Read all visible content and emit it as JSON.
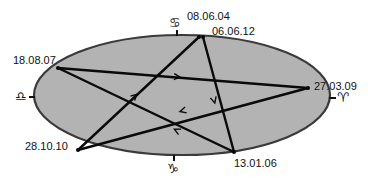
{
  "diagram": {
    "type": "pentagram-in-ellipse",
    "colors": {
      "ellipse_fill": "#b3b3b3",
      "ellipse_stroke": "#3a3a3a",
      "line": "#0a0a0a",
      "text": "#111111"
    },
    "points": {
      "p_top_a": {
        "label": "08.06.04"
      },
      "p_top_b": {
        "label": "06.06.12"
      },
      "p_left": {
        "label": "18.08.07"
      },
      "p_right": {
        "label": "27.03.09"
      },
      "p_bottom_left": {
        "label": "28.10.10"
      },
      "p_bottom_right": {
        "label": "13.01.06"
      }
    },
    "zodiac_markers": {
      "top": {
        "name": "cancer",
        "glyph": "♋"
      },
      "left": {
        "name": "libra",
        "glyph": "♎"
      },
      "right": {
        "name": "aries",
        "glyph": "♈"
      },
      "bottom": {
        "name": "capricorn",
        "glyph": "♑"
      }
    },
    "edges": [
      {
        "from": "18.08.07",
        "to": "27.03.09",
        "arrow": "forward"
      },
      {
        "from": "27.03.09",
        "to": "28.10.10",
        "arrow": "forward"
      },
      {
        "from": "28.10.10",
        "to": "08.06.04",
        "arrow": "forward"
      },
      {
        "from": "06.06.12",
        "to": "13.01.06",
        "arrow": "forward"
      },
      {
        "from": "13.01.06",
        "to": "18.08.07",
        "arrow": "forward"
      }
    ]
  }
}
